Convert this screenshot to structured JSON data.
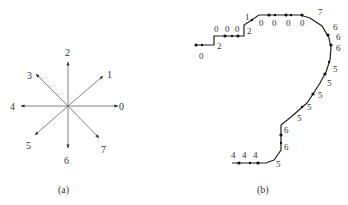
{
  "panel_a": {
    "caption": "(a)",
    "directions": [
      {
        "label": "0",
        "angle": 0
      },
      {
        "label": "1",
        "angle": 45
      },
      {
        "label": "2",
        "angle": 90
      },
      {
        "label": "3",
        "angle": 135
      },
      {
        "label": "4",
        "angle": 180
      },
      {
        "label": "5",
        "angle": 225
      },
      {
        "label": "6",
        "angle": 270
      },
      {
        "label": "7",
        "angle": 315
      }
    ]
  },
  "panel_b": {
    "caption": "(b)",
    "chain_labels": [
      "0",
      "2",
      "0",
      "0",
      "0",
      "2",
      "1",
      "0",
      "0",
      "0",
      "0",
      "7",
      "6",
      "6",
      "6",
      "5",
      "5",
      "5",
      "5",
      "5",
      "6",
      "6",
      "5",
      "4",
      "4",
      "4"
    ]
  },
  "colors": {
    "line": "#555555",
    "path": "#222222",
    "text": "#333333"
  }
}
